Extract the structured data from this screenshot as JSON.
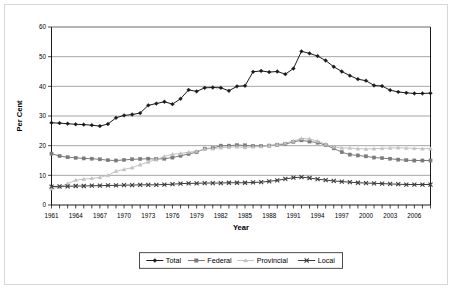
{
  "figure": {
    "background_color": "#ffffff",
    "border_color": "#d8d8d8"
  },
  "chart_data": {
    "type": "line",
    "title": "",
    "xlabel": "Year",
    "ylabel": "Per Cent",
    "xlim": [
      1961,
      2008
    ],
    "ylim": [
      0,
      60
    ],
    "yticks": [
      0,
      10,
      20,
      30,
      40,
      50,
      60
    ],
    "ytick_labels": [
      "0",
      "10",
      "20",
      "30",
      "40",
      "50",
      "60"
    ],
    "xtick_labels": [
      "1961",
      "1964",
      "1967",
      "1970",
      "1973",
      "1976",
      "1979",
      "1982",
      "1985",
      "1988",
      "1991",
      "1994",
      "1997",
      "2000",
      "2003",
      "2006"
    ],
    "xtick_label_values": [
      1961,
      1964,
      1967,
      1970,
      1973,
      1976,
      1979,
      1982,
      1985,
      1988,
      1991,
      1994,
      1997,
      2000,
      2003,
      2006
    ],
    "grid": "horizontal",
    "legend_position": "bottom",
    "x": [
      1961,
      1962,
      1963,
      1964,
      1965,
      1966,
      1967,
      1968,
      1969,
      1970,
      1971,
      1972,
      1973,
      1974,
      1975,
      1976,
      1977,
      1978,
      1979,
      1980,
      1981,
      1982,
      1983,
      1984,
      1985,
      1986,
      1987,
      1988,
      1989,
      1990,
      1991,
      1992,
      1993,
      1994,
      1995,
      1996,
      1997,
      1998,
      1999,
      2000,
      2001,
      2002,
      2003,
      2004,
      2005,
      2006,
      2007,
      2008
    ],
    "series": [
      {
        "name": "Total",
        "color": "#1a1a1a",
        "marker": "diamond",
        "values": [
          27.7,
          27.6,
          27.4,
          27.2,
          27.1,
          26.9,
          26.6,
          27.3,
          29.4,
          30.2,
          30.5,
          31.0,
          33.6,
          34.2,
          34.8,
          34.0,
          35.8,
          38.8,
          38.3,
          39.5,
          39.6,
          39.5,
          38.5,
          40.0,
          40.2,
          44.9,
          45.2,
          44.8,
          45.0,
          44.1,
          46.0,
          51.8,
          51.1,
          50.2,
          48.7,
          46.6,
          45.0,
          43.6,
          42.4,
          41.9,
          40.3,
          40.1,
          38.7,
          38.1,
          37.8,
          37.6,
          37.6,
          37.7
        ]
      },
      {
        "name": "Federal",
        "color": "#7a7a7a",
        "marker": "square",
        "values": [
          17.3,
          16.5,
          16.1,
          15.9,
          15.7,
          15.6,
          15.4,
          15.1,
          15.0,
          15.2,
          15.4,
          15.5,
          15.6,
          15.5,
          15.6,
          16.0,
          16.6,
          17.2,
          17.8,
          19.0,
          19.2,
          20.0,
          20.0,
          20.2,
          20.1,
          19.9,
          19.9,
          20.0,
          20.3,
          20.5,
          21.3,
          21.8,
          21.4,
          21.0,
          20.2,
          19.1,
          17.8,
          17.0,
          16.7,
          16.4,
          16.0,
          15.8,
          15.6,
          15.3,
          15.1,
          15.0,
          15.0,
          15.0
        ]
      },
      {
        "name": "Provincial",
        "color": "#c2c2c2",
        "marker": "triangle",
        "values": [
          5.5,
          6.1,
          7.2,
          8.4,
          8.7,
          9.0,
          9.3,
          10.0,
          11.4,
          12.0,
          12.6,
          13.6,
          14.5,
          15.3,
          16.4,
          17.1,
          17.4,
          17.8,
          18.1,
          18.9,
          19.0,
          19.3,
          19.5,
          19.6,
          19.4,
          19.6,
          19.7,
          20.1,
          20.4,
          20.8,
          21.6,
          22.4,
          22.3,
          21.5,
          20.5,
          19.6,
          19.2,
          19.2,
          19.0,
          18.9,
          19.0,
          19.1,
          19.2,
          19.3,
          19.2,
          19.1,
          19.0,
          19.0
        ]
      },
      {
        "name": "Local",
        "color": "#3c3c3c",
        "marker": "x",
        "values": [
          6.2,
          6.3,
          6.3,
          6.4,
          6.4,
          6.5,
          6.5,
          6.6,
          6.6,
          6.7,
          6.7,
          6.8,
          6.8,
          6.8,
          6.9,
          7.0,
          7.2,
          7.3,
          7.3,
          7.4,
          7.4,
          7.4,
          7.5,
          7.5,
          7.5,
          7.6,
          7.7,
          8.0,
          8.3,
          8.8,
          9.2,
          9.4,
          9.1,
          8.7,
          8.4,
          8.1,
          7.9,
          7.7,
          7.5,
          7.4,
          7.3,
          7.2,
          7.1,
          7.0,
          6.9,
          6.9,
          6.9,
          6.9
        ]
      }
    ]
  }
}
